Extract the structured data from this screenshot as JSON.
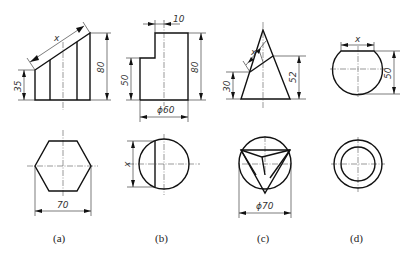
{
  "figure": {
    "type": "engineering-projection-exercises",
    "panels": [
      {
        "id": "a",
        "caption": "(a)",
        "front_view": "truncated hexagonal prism with sloped top",
        "top_view": "regular hexagon",
        "dimensions": {
          "slope_length": "x",
          "left_height": "35",
          "right_height": "80",
          "across_corners": "70"
        }
      },
      {
        "id": "b",
        "caption": "(b)",
        "front_view": "stepped cylinder (notch at top-left)",
        "top_view": "circle with chord line",
        "dimensions": {
          "notch_width": "10",
          "step_height": "50",
          "total_height": "80",
          "diameter": "ϕ60",
          "chord_length": "x"
        }
      },
      {
        "id": "c",
        "caption": "(c)",
        "front_view": "cone cut by inclined plane",
        "top_view": "circle with inscribed triangle and cut outline",
        "dimensions": {
          "cut_length": "x",
          "low_cut_height": "30",
          "high_cut_height": "52",
          "diameter": "ϕ70"
        }
      },
      {
        "id": "d",
        "caption": "(d)",
        "front_view": "truncated sphere",
        "top_view": "concentric circles",
        "dimensions": {
          "top_width": "x",
          "height": "50"
        }
      }
    ]
  },
  "labels": {
    "a_x": "x",
    "a_35": "35",
    "a_80": "80",
    "a_70": "70",
    "a_cap": "(a)",
    "b_10": "10",
    "b_50": "50",
    "b_80": "80",
    "b_60": "ϕ60",
    "b_x": "x",
    "b_cap": "(b)",
    "c_x": "x",
    "c_30": "30",
    "c_52": "52",
    "c_70": "ϕ70",
    "c_cap": "(c)",
    "d_x": "x",
    "d_50": "50",
    "d_cap": "(d)"
  }
}
